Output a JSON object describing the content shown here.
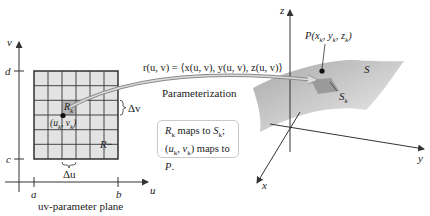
{
  "uv_plane": {
    "axis_u": "u",
    "axis_v": "v",
    "tick_a": "a",
    "tick_b": "b",
    "tick_c": "c",
    "tick_d": "d",
    "region_label": "R",
    "cell_label": "R",
    "cell_label_sub": "k",
    "point_label": "(u_k, v_k)",
    "delta_u": "Δu",
    "delta_v": "Δv",
    "caption": "uv-parameter plane",
    "grid": {
      "rows": 6,
      "cols": 6,
      "highlight_row": 2,
      "highlight_col": 2
    }
  },
  "mapping": {
    "formula": "r(u, v) = ⟨x(u, v), y(u, v), z(u, v)⟩",
    "caption": "Parameterization"
  },
  "note": {
    "line1": "R_k maps to S_k;",
    "line2": "(u_k, v_k) maps to P."
  },
  "space": {
    "axis_x": "x",
    "axis_y": "y",
    "axis_z": "z",
    "surface_label": "S",
    "patch_label": "S",
    "patch_label_sub": "k",
    "point_label": "P(x_k, y_k, z_k)"
  },
  "colors": {
    "grid_fill": "#e2e2e2",
    "cell_highlight": "#b5b5b5",
    "surface": "#c8c8c8",
    "line": "#333333"
  }
}
